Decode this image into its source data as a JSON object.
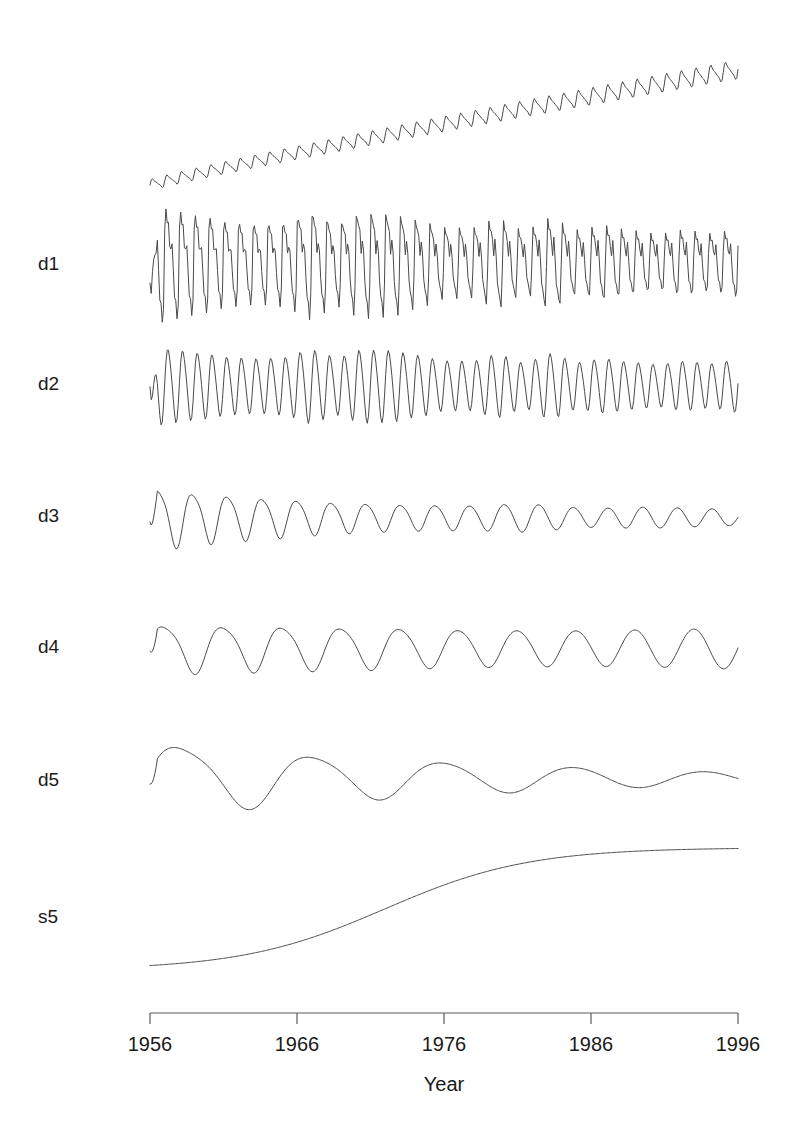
{
  "figure": {
    "background_color": "#ffffff",
    "line_color": "#4a4a4a",
    "axis_color": "#5a5a5a",
    "text_color": "#1a1a1a"
  },
  "chart_data": {
    "type": "line",
    "title": "",
    "subtitle": "",
    "xlabel": "Year",
    "ylabel": "",
    "grid": false,
    "legend": "none",
    "xlim": [
      1956,
      1996
    ],
    "x_ticks": [
      1956,
      1966,
      1976,
      1986,
      1996
    ],
    "x_tick_labels": [
      "1956",
      "1966",
      "1976",
      "1986",
      "1996"
    ],
    "n_points": 480,
    "panels": [
      {
        "label": "",
        "name": "original-series",
        "kind": "original",
        "note": "Rising trend with growing annual seasonal oscillation",
        "trend_start": 0.08,
        "trend_end": 0.93,
        "seasonal_amp_start": 0.06,
        "seasonal_amp_end": 0.1,
        "cycles": 40
      },
      {
        "label": "d1",
        "name": "detail-level-1",
        "kind": "detail",
        "note": "High-frequency detail, sharp spikes, amplitude decaying then stabilising",
        "cycles": 40,
        "amp_start": 1.0,
        "amp_end": 0.52,
        "spikiness": 0.85
      },
      {
        "label": "d2",
        "name": "detail-level-2",
        "kind": "detail",
        "note": "Regular annual oscillation with slowly decaying amplitude",
        "cycles": 40,
        "amp_start": 1.0,
        "amp_end": 0.62,
        "spikiness": 0.1
      },
      {
        "label": "d3",
        "name": "detail-level-3",
        "kind": "detail",
        "note": "Lower-frequency ripple, strong early burst then small steady waves",
        "cycles": 17,
        "amp_start": 1.0,
        "amp_end": 0.22,
        "spikiness": 0.0
      },
      {
        "label": "d4",
        "name": "detail-level-4",
        "kind": "detail",
        "note": "Roughly ten slow cycles of moderate, fairly even amplitude",
        "cycles": 10,
        "amp_start": 0.85,
        "amp_end": 0.8,
        "spikiness": 0.0
      },
      {
        "label": "d5",
        "name": "detail-level-5",
        "kind": "detail",
        "note": "Four to five long cycles with clearly decaying amplitude",
        "cycles": 4.5,
        "amp_start": 1.0,
        "amp_end": 0.18,
        "spikiness": 0.0
      },
      {
        "label": "s5",
        "name": "smooth-level-5",
        "kind": "smooth",
        "note": "Smooth monotone S-shaped trend rising and flattening",
        "start": 0.05,
        "end": 0.95
      }
    ]
  }
}
